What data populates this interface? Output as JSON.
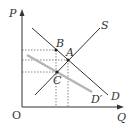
{
  "diagram": {
    "type": "supply-demand",
    "axes": {
      "y_label": "P",
      "x_label": "Q",
      "origin_label": "O"
    },
    "curves": [
      {
        "name": "S",
        "label": "S",
        "color": "#333333"
      },
      {
        "name": "D",
        "label": "D",
        "color": "#333333"
      },
      {
        "name": "D'",
        "label": "D′",
        "color": "#b0b0b0"
      }
    ],
    "points": [
      {
        "label": "A"
      },
      {
        "label": "B"
      },
      {
        "label": "C"
      }
    ]
  }
}
